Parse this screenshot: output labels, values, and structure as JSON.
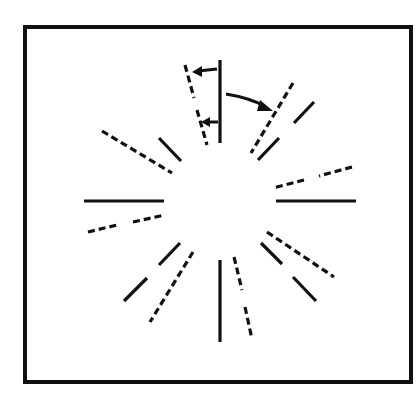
{
  "figure": {
    "description": "Radial tilt illusion diagram: pairs of solid (reference) and dashed (perceived/shifted) line segments arranged radially around an empty center, with arrows indicating rotation direction.",
    "frame": {
      "x": 25,
      "y": 27,
      "width": 386,
      "height": 355
    },
    "center": {
      "x": 220,
      "y": 201
    },
    "colors": {
      "line": "#111111",
      "background": "#ffffff"
    },
    "solid_lines": [
      {
        "id": "top",
        "x1": 220,
        "y1": 60,
        "x2": 220,
        "y2": 143
      },
      {
        "id": "upper-right-outer",
        "x1": 314,
        "y1": 102,
        "x2": 294,
        "y2": 123
      },
      {
        "id": "upper-right-inner",
        "x1": 279,
        "y1": 138,
        "x2": 258,
        "y2": 160
      },
      {
        "id": "right",
        "x1": 276,
        "y1": 201,
        "x2": 356,
        "y2": 201
      },
      {
        "id": "lower-right-inner",
        "x1": 261,
        "y1": 243,
        "x2": 282,
        "y2": 264
      },
      {
        "id": "lower-right-outer",
        "x1": 293,
        "y1": 277,
        "x2": 316,
        "y2": 301
      },
      {
        "id": "bottom",
        "x1": 220,
        "y1": 260,
        "x2": 220,
        "y2": 342
      },
      {
        "id": "lower-left-inner",
        "x1": 180,
        "y1": 243,
        "x2": 159,
        "y2": 265
      },
      {
        "id": "lower-left-outer",
        "x1": 147,
        "y1": 278,
        "x2": 124,
        "y2": 301
      },
      {
        "id": "left",
        "x1": 84,
        "y1": 201,
        "x2": 164,
        "y2": 201
      },
      {
        "id": "upper-left",
        "x1": 159,
        "y1": 138,
        "x2": 181,
        "y2": 161
      }
    ],
    "dashed_lines": [
      {
        "id": "top-outer",
        "x1": 185,
        "y1": 65,
        "x2": 194,
        "y2": 98
      },
      {
        "id": "top-inner",
        "x1": 197,
        "y1": 110,
        "x2": 207,
        "y2": 145
      },
      {
        "id": "upper-right",
        "x1": 293,
        "y1": 83,
        "x2": 251,
        "y2": 153
      },
      {
        "id": "right-outer",
        "x1": 352,
        "y1": 167,
        "x2": 319,
        "y2": 176
      },
      {
        "id": "right-inner",
        "x1": 304,
        "y1": 180,
        "x2": 273,
        "y2": 188
      },
      {
        "id": "lower-right",
        "x1": 267,
        "y1": 232,
        "x2": 334,
        "y2": 277
      },
      {
        "id": "bottom-outer",
        "x1": 234,
        "y1": 257,
        "x2": 242,
        "y2": 290
      },
      {
        "id": "bottom-inner",
        "x1": 245,
        "y1": 307,
        "x2": 252,
        "y2": 339
      },
      {
        "id": "lower-left",
        "x1": 193,
        "y1": 252,
        "x2": 150,
        "y2": 322
      },
      {
        "id": "left-outer",
        "x1": 88,
        "y1": 232,
        "x2": 117,
        "y2": 225
      },
      {
        "id": "left-inner",
        "x1": 133,
        "y1": 222,
        "x2": 165,
        "y2": 215
      },
      {
        "id": "upper-left",
        "x1": 102,
        "y1": 131,
        "x2": 172,
        "y2": 173
      }
    ],
    "arrows": [
      {
        "id": "top-upper-arrow",
        "path": "M 217 69 L 198 71",
        "head": "192,72 202,66 202,77"
      },
      {
        "id": "top-lower-arrow",
        "path": "M 218 122 L 208 122",
        "head": "201,122 210,117 210,127"
      },
      {
        "id": "curved-arrow",
        "path": "M 226 94 Q 250 98 264 106",
        "head": "273,111 260,100 257,111"
      }
    ]
  }
}
